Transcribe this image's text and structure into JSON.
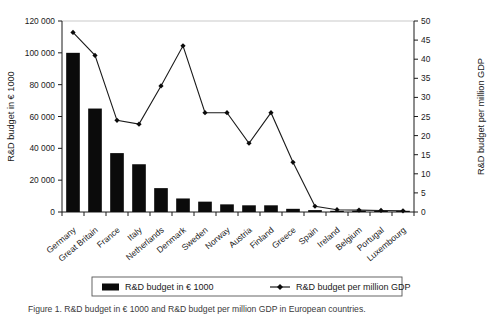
{
  "chart_data": {
    "type": "bar",
    "title": "",
    "categories": [
      "Germany",
      "Great Britain",
      "France",
      "Italy",
      "Netherlands",
      "Denmark",
      "Sweden",
      "Norway",
      "Austria",
      "Finland",
      "Greece",
      "Spain",
      "Ireland",
      "Belgium",
      "Portugal",
      "Luxembourg"
    ],
    "series": [
      {
        "name": "R&D budget in € 1000",
        "type": "bar",
        "axis": "left",
        "values": [
          100000,
          65000,
          37000,
          30000,
          15000,
          8500,
          6500,
          4800,
          4200,
          4200,
          2000,
          1200,
          400,
          250,
          200,
          150
        ]
      },
      {
        "name": "R&D budget per million GDP",
        "type": "line",
        "axis": "right",
        "values": [
          47,
          41,
          24,
          23,
          33,
          43.5,
          26,
          26,
          18,
          26,
          13,
          1.5,
          0.6,
          0.5,
          0.4,
          0.3
        ]
      }
    ],
    "xlabel": "",
    "ylabel": "R&D budget in € 1000",
    "y2label": "R&D budget per million GDP",
    "ylim": [
      0,
      120000
    ],
    "y2lim": [
      0,
      50
    ],
    "yticks": [
      "0",
      "20 000",
      "40 000",
      "60 000",
      "80 000",
      "100 000",
      "120 000"
    ],
    "ytick_values": [
      0,
      20000,
      40000,
      60000,
      80000,
      100000,
      120000
    ],
    "y2ticks": [
      "0",
      "5",
      "10",
      "15",
      "20",
      "25",
      "30",
      "35",
      "40",
      "45",
      "50"
    ],
    "y2tick_values": [
      0,
      5,
      10,
      15,
      20,
      25,
      30,
      35,
      40,
      45,
      50
    ],
    "grid": false,
    "legend_position": "bottom",
    "legend": [
      {
        "label": "R&D budget in € 1000",
        "marker": "filled-square",
        "color": "#0b0b0b"
      },
      {
        "label": "R&D budget per million GDP",
        "marker": "line-with-diamond",
        "color": "#1a1a1a"
      }
    ],
    "colors": {
      "bar": "#0b0b0b",
      "line": "#1a1a1a",
      "axis": "#1a1a1a"
    }
  },
  "caption": "Figure 1. R&D budget in € 1000 and R&D budget per million GDP in European countries."
}
